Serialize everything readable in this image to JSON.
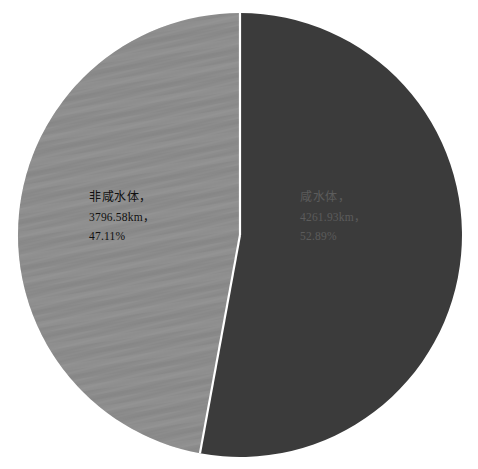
{
  "chart_data": {
    "type": "pie",
    "title": "",
    "legend_position": "none",
    "grid": false,
    "unit": "km",
    "categories": [
      "非咸水体",
      "咸水体"
    ],
    "values": [
      3796.58,
      4261.93
    ],
    "percentages": [
      47.11,
      52.89
    ],
    "total": 8058.51,
    "colors": [
      "#8c8c8c",
      "#3b3b3b"
    ],
    "slices": [
      {
        "name": "非咸水体",
        "value": 3796.58,
        "value_label": "3796.58km，",
        "percent": 47.11,
        "percent_label": "47.11%",
        "name_label": "非咸水体，",
        "color": "#8c8c8c",
        "label_color": "#101010",
        "start_angle_deg": 190.4,
        "end_angle_deg": 360.0
      },
      {
        "name": "咸水体",
        "value": 4261.93,
        "value_label": "4261.93km，",
        "percent": 52.89,
        "percent_label": "52.89%",
        "name_label": "咸水体，",
        "color": "#3b3b3b",
        "label_color": "#5c5c5c",
        "start_angle_deg": 0.0,
        "end_angle_deg": 190.4
      }
    ]
  },
  "canvas": {
    "background": "#ffffff",
    "divider_color": "#ffffff"
  }
}
